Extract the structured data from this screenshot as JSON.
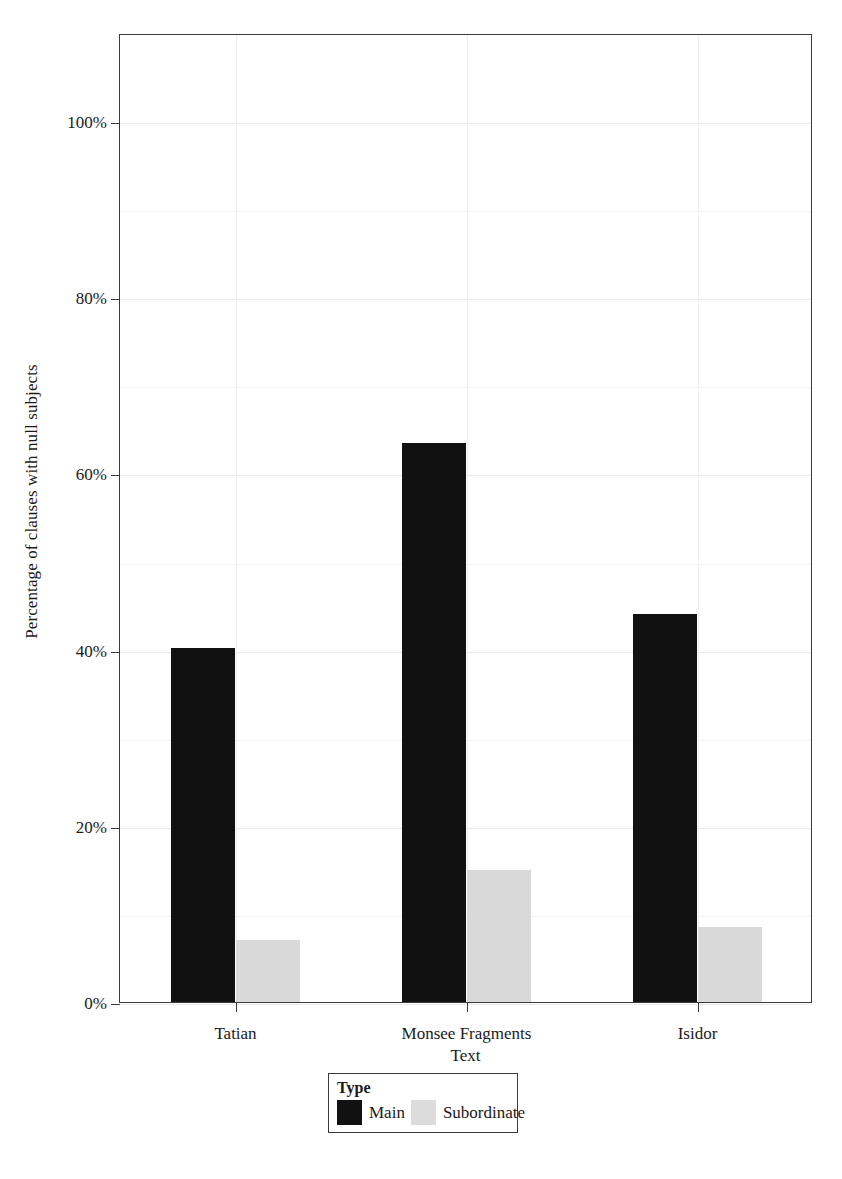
{
  "chart_data": {
    "type": "bar",
    "title": "",
    "xlabel": "Text",
    "ylabel": "Percentage of clauses with null subjects",
    "categories": [
      "Tatian",
      "Monsee Fragments",
      "Isidor"
    ],
    "series": [
      {
        "name": "Main",
        "color": "#111111",
        "values": [
          40.2,
          63.5,
          44.0
        ]
      },
      {
        "name": "Subordinate",
        "color": "#d9d9d9",
        "values": [
          7.0,
          15.0,
          8.5
        ]
      }
    ],
    "ylim": [
      0,
      110
    ],
    "yticks": [
      0,
      20,
      40,
      60,
      80,
      100
    ],
    "ytick_labels": [
      "0%",
      "20%",
      "40%",
      "60%",
      "80%",
      "100%"
    ],
    "minor_yticks": [
      10,
      30,
      50,
      70,
      90
    ],
    "grid": true,
    "legend": {
      "title": "Type",
      "position": "bottom-center",
      "entries": [
        {
          "label": "Main",
          "swatch": "main"
        },
        {
          "label": "Subordinate",
          "swatch": "sub"
        }
      ]
    }
  },
  "caption": ""
}
